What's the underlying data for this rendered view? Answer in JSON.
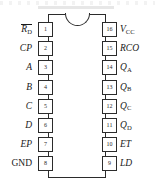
{
  "figure": {
    "kind": "dip-ic-pinout",
    "package": "16-pin DIP",
    "notch": "semicircle-top",
    "ink_color": "#2b2b2b",
    "background_color": "#ffffff"
  },
  "pins": {
    "left": [
      {
        "number": "1",
        "label_main": "R",
        "label_sub": "D",
        "overbar": true,
        "italic": true,
        "plain": null
      },
      {
        "number": "2",
        "label_main": "CP",
        "label_sub": null,
        "overbar": false,
        "italic": true,
        "plain": null
      },
      {
        "number": "3",
        "label_main": "A",
        "label_sub": null,
        "overbar": false,
        "italic": true,
        "plain": null
      },
      {
        "number": "4",
        "label_main": "B",
        "label_sub": null,
        "overbar": false,
        "italic": true,
        "plain": null
      },
      {
        "number": "5",
        "label_main": "C",
        "label_sub": null,
        "overbar": false,
        "italic": true,
        "plain": null
      },
      {
        "number": "6",
        "label_main": "D",
        "label_sub": null,
        "overbar": false,
        "italic": true,
        "plain": null
      },
      {
        "number": "7",
        "label_main": "EP",
        "label_sub": null,
        "overbar": false,
        "italic": true,
        "plain": null
      },
      {
        "number": "8",
        "label_main": null,
        "label_sub": null,
        "overbar": false,
        "italic": false,
        "plain": "GND"
      }
    ],
    "right": [
      {
        "number": "16",
        "label_main": "V",
        "label_sub": "CC",
        "overbar": false,
        "italic": true,
        "plain": null
      },
      {
        "number": "15",
        "label_main": "RCO",
        "label_sub": null,
        "overbar": false,
        "italic": true,
        "plain": null
      },
      {
        "number": "14",
        "label_main": "Q",
        "label_sub": "A",
        "overbar": false,
        "italic": true,
        "plain": null
      },
      {
        "number": "13",
        "label_main": "Q",
        "label_sub": "B",
        "overbar": false,
        "italic": true,
        "plain": null
      },
      {
        "number": "12",
        "label_main": "Q",
        "label_sub": "C",
        "overbar": false,
        "italic": true,
        "plain": null
      },
      {
        "number": "11",
        "label_main": "Q",
        "label_sub": "D",
        "overbar": false,
        "italic": true,
        "plain": null
      },
      {
        "number": "10",
        "label_main": "ET",
        "label_sub": null,
        "overbar": false,
        "italic": true,
        "plain": null
      },
      {
        "number": "9",
        "label_main": "LD",
        "label_sub": null,
        "overbar": false,
        "italic": true,
        "plain": null
      }
    ]
  }
}
